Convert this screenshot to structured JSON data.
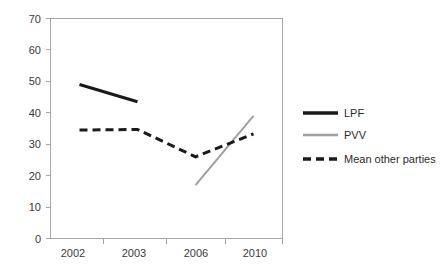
{
  "chart_data": {
    "type": "line",
    "title": "",
    "subtitle": "",
    "xlabel": "",
    "ylabel": "",
    "categories": [
      "2002",
      "2003",
      "2006",
      "2010"
    ],
    "ylim": [
      0,
      70
    ],
    "yticks": [
      0,
      10,
      20,
      30,
      40,
      50,
      60,
      70
    ],
    "ytick_labels": [
      "0",
      "10",
      "20",
      "30",
      "40",
      "50",
      "60",
      "70"
    ],
    "grid": false,
    "legend_position": "right",
    "series": [
      {
        "name": "LPF",
        "style": "solid",
        "color": "#1a1a1a",
        "width": 3,
        "x": [
          "2002",
          "2003"
        ],
        "values": [
          49,
          43.5
        ]
      },
      {
        "name": "PVV",
        "style": "solid",
        "color": "#a0a0a0",
        "width": 2,
        "x": [
          "2006",
          "2010"
        ],
        "values": [
          17,
          39
        ]
      },
      {
        "name": "Mean other parties",
        "style": "dashed",
        "color": "#1a1a1a",
        "width": 3,
        "x": [
          "2002",
          "2003",
          "2006",
          "2010"
        ],
        "values": [
          34.5,
          34.7,
          26,
          33.3
        ]
      }
    ]
  },
  "axes": {
    "y": {
      "labels": [
        {
          "text": "70",
          "value": 70
        },
        {
          "text": "60",
          "value": 60
        },
        {
          "text": "50",
          "value": 50
        },
        {
          "text": "40",
          "value": 40
        },
        {
          "text": "30",
          "value": 30
        },
        {
          "text": "20",
          "value": 20
        },
        {
          "text": "10",
          "value": 10
        },
        {
          "text": "0",
          "value": 0
        }
      ]
    },
    "x": {
      "labels": [
        {
          "text": "2002"
        },
        {
          "text": "2003"
        },
        {
          "text": "2006"
        },
        {
          "text": "2010"
        }
      ]
    }
  },
  "legend": {
    "items": [
      {
        "label": "LPF",
        "color": "#1a1a1a",
        "style": "solid"
      },
      {
        "label": "PVV",
        "color": "#a0a0a0",
        "style": "solid"
      },
      {
        "label": "Mean other parties",
        "color": "#1a1a1a",
        "style": "dashed"
      }
    ]
  },
  "colors": {
    "background": "#ffffff",
    "axis": "#a6a6a6",
    "text": "#3b3b3b",
    "lpf": "#1a1a1a",
    "pvv": "#a0a0a0",
    "mean_other": "#1a1a1a"
  }
}
